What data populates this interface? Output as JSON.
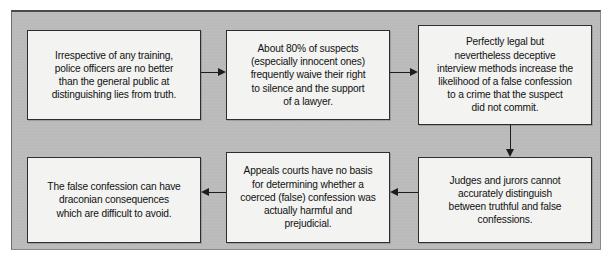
{
  "diagram": {
    "panel_color": "#bebebe",
    "node_fill": "#f3f3f1",
    "node_border": "#2e2e2e",
    "arrow_color": "#1d1d1d",
    "nodes": [
      {
        "id": "training",
        "name": "node-police-training",
        "text": "Irrespective of any training,\npolice officers are no better\nthan the general public at\ndistinguishing lies from truth."
      },
      {
        "id": "waiver",
        "name": "node-rights-waiver",
        "text": "About 80% of suspects\n(especially innocent ones)\nfrequently waive their right\nto silence and the support\nof a lawyer."
      },
      {
        "id": "interview",
        "name": "node-deceptive-interview",
        "text": "Perfectly legal but\nnevertheless deceptive\ninterview methods increase the\nlikelihood of a false confession\nto a crime that the suspect\ndid not commit."
      },
      {
        "id": "judges",
        "name": "node-judges-jurors",
        "text": "Judges and jurors cannot\naccurately distinguish\nbetween truthful and false\nconfessions."
      },
      {
        "id": "appeals",
        "name": "node-appeals-courts",
        "text": "Appeals courts have no basis\nfor determining whether a\ncoerced (false) confession was\nactually harmful and\nprejudicial."
      },
      {
        "id": "consequences",
        "name": "node-draconian-consequences",
        "text": "The false confession can have\ndraconian consequences\nwhich are difficult to avoid."
      }
    ],
    "arrows": [
      {
        "id": "training-to-waiver",
        "direction": "right"
      },
      {
        "id": "waiver-to-interview",
        "direction": "right"
      },
      {
        "id": "interview-to-judges",
        "direction": "down"
      },
      {
        "id": "judges-to-appeals",
        "direction": "left"
      },
      {
        "id": "appeals-to-consequences",
        "direction": "left"
      }
    ]
  }
}
